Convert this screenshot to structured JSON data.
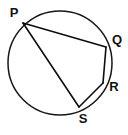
{
  "figure": {
    "background_color": "#ffffff",
    "stroke_color": "#111111",
    "label_color": "#111111",
    "canvas": {
      "width": 128,
      "height": 135
    },
    "circle": {
      "name": "circle",
      "center_x": 60,
      "center_y": 63,
      "radius": 52,
      "stroke_width": 1.5
    },
    "points": [
      {
        "id": "P",
        "label": "P",
        "x": 23,
        "y": 23,
        "label_x": 14,
        "label_y": 14
      },
      {
        "id": "Q",
        "label": "Q",
        "x": 106,
        "y": 47,
        "label_x": 117,
        "label_y": 41
      },
      {
        "id": "R",
        "label": "R",
        "x": 103,
        "y": 83,
        "label_x": 114,
        "label_y": 88
      },
      {
        "id": "S",
        "label": "S",
        "x": 79,
        "y": 107,
        "label_x": 83,
        "label_y": 120
      }
    ],
    "chords": [
      {
        "id": "PQ",
        "from": "P",
        "to": "Q",
        "x1": 23,
        "y1": 23,
        "x2": 106,
        "y2": 47
      },
      {
        "id": "PS",
        "from": "P",
        "to": "S",
        "x1": 23,
        "y1": 23,
        "x2": 79,
        "y2": 107
      },
      {
        "id": "QR",
        "from": "Q",
        "to": "R",
        "x1": 106,
        "y1": 47,
        "x2": 103,
        "y2": 83
      },
      {
        "id": "RS",
        "from": "R",
        "to": "S",
        "x1": 103,
        "y1": 83,
        "x2": 79,
        "y2": 107
      }
    ]
  }
}
